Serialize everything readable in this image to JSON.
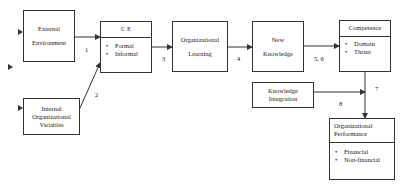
{
  "diagram": {
    "nodes": {
      "external_environment": {
        "line1": "External",
        "line2": "Environment"
      },
      "internal_variables": {
        "line1": "Internal",
        "line2": "Organizational",
        "line3": "Variables"
      },
      "ce": {
        "title": "C E",
        "items": [
          "Formal",
          "Informal"
        ]
      },
      "org_learning": {
        "line1": "Organizational",
        "line2": "Learning"
      },
      "new_knowledge": {
        "line1": "New",
        "line2": "Knowledge"
      },
      "competence": {
        "title": "Competence",
        "items": [
          "Domain",
          "Thrust"
        ]
      },
      "knowledge_integration": {
        "line1": "Knowledge",
        "line2": "Integration"
      },
      "org_performance": {
        "title_line1": "Organizational",
        "title_line2": "Performance",
        "items": [
          "Financial",
          "Non-financial"
        ]
      }
    },
    "edge_labels": {
      "e1": "1",
      "e2": "2",
      "e3": "3",
      "e4": "4",
      "e56": "5, 6",
      "e7": "7",
      "e8": "8"
    },
    "colors": {
      "line": "#333333",
      "background": "#ffffff"
    }
  }
}
